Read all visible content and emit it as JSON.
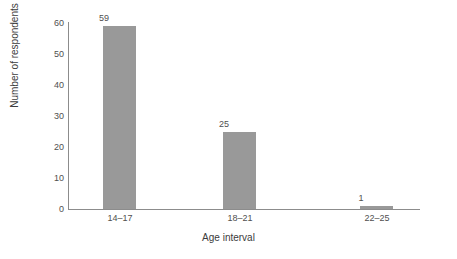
{
  "chart_data": {
    "type": "bar",
    "title": "",
    "subtitle": "",
    "xlabel": "Age interval",
    "ylabel": "Number of respondents",
    "categories": [
      "14–17",
      "18–21",
      "22–25"
    ],
    "values": [
      59,
      25,
      1
    ],
    "data_labels": [
      "59",
      "25",
      "1"
    ],
    "ylim": [
      0,
      60
    ],
    "yticks": [
      0,
      10,
      20,
      30,
      40,
      50,
      60
    ],
    "ytick_labels": [
      "0",
      "10",
      "20",
      "30",
      "40",
      "50",
      "60"
    ],
    "grid": false,
    "legend": null,
    "series": [
      {
        "name": "Number of respondents",
        "values": [
          59,
          25,
          1
        ],
        "color": "#999999"
      }
    ],
    "colors": {
      "bar": "#999999",
      "axis": "#8c8c8c",
      "text": "#4f4f4f",
      "background": "#ffffff"
    }
  }
}
